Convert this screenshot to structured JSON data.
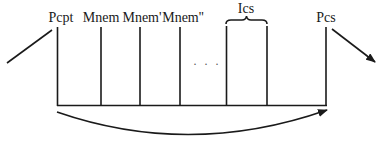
{
  "diagram": {
    "labels": {
      "pcpt": "Pcpt",
      "mnem": "Mnem",
      "mnem_prime": "Mnem'",
      "mnem_double_prime": "Mnem''",
      "ics": "Ics",
      "pcs": "Pcs"
    },
    "ellipsis": "· · ·",
    "colors": {
      "stroke": "#1a1a1a",
      "background": "#ffffff"
    }
  }
}
